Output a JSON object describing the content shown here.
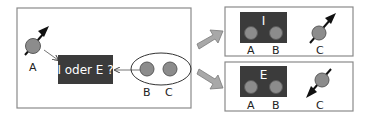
{
  "diagram": {
    "colors": {
      "panel_border": "#8a8a8a",
      "dark_box": "#3b3b3b",
      "particle": "#8c8c8c",
      "particle_stroke": "#5a5a5a",
      "arrow": "#111111",
      "block_arrow": "#a8a8a8",
      "label": "#222222"
    },
    "left_panel": {
      "particle_a_label": "A",
      "question_box_text": "I oder E ?",
      "particle_b_label": "B",
      "particle_c_label": "C"
    },
    "top_right_panel": {
      "box_label": "I",
      "particle_a_label": "A",
      "particle_b_label": "B",
      "particle_c_label": "C"
    },
    "bottom_right_panel": {
      "box_label": "E",
      "particle_a_label": "A",
      "particle_b_label": "B",
      "particle_c_label": "C"
    }
  }
}
